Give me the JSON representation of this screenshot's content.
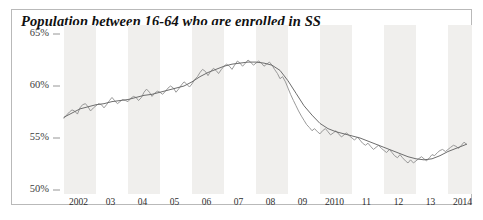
{
  "figure": {
    "width": 483,
    "height": 220,
    "background_color": "#ffffff",
    "frame_color": "#b9b9b9",
    "band_color": "#f0efed"
  },
  "chart_data": {
    "type": "line",
    "title": "Population between 16-64 who are enrolled in SS",
    "xlabel": "",
    "ylabel": "",
    "ylim": [
      50,
      65
    ],
    "xlim": [
      2002,
      2014.75
    ],
    "grid": false,
    "legend_position": "none",
    "y_tick_labels": [
      "65%",
      "60%",
      "55%",
      "50%"
    ],
    "y_tick_values": [
      65,
      60,
      55,
      50
    ],
    "x_tick_labels": [
      "2002",
      "03",
      "04",
      "05",
      "06",
      "07",
      "08",
      "09",
      "2010",
      "11",
      "12",
      "13",
      "2014"
    ],
    "x_tick_values": [
      2002,
      2003,
      2004,
      2005,
      2006,
      2007,
      2008,
      2009,
      2010,
      2011,
      2012,
      2013,
      2014
    ],
    "shaded_bands": [
      [
        2002,
        2003
      ],
      [
        2004,
        2005
      ],
      [
        2006,
        2007
      ],
      [
        2008,
        2009
      ],
      [
        2010,
        2011
      ],
      [
        2012,
        2013
      ],
      [
        2014,
        2014.75
      ]
    ],
    "series": [
      {
        "name": "Monthly (unadjusted)",
        "color": "#8e8e8e",
        "width": 0.9,
        "x": [
          2002.0,
          2002.08,
          2002.17,
          2002.25,
          2002.33,
          2002.42,
          2002.5,
          2002.58,
          2002.67,
          2002.75,
          2002.83,
          2002.92,
          2003.0,
          2003.08,
          2003.17,
          2003.25,
          2003.33,
          2003.42,
          2003.5,
          2003.58,
          2003.67,
          2003.75,
          2003.83,
          2003.92,
          2004.0,
          2004.08,
          2004.17,
          2004.25,
          2004.33,
          2004.42,
          2004.5,
          2004.58,
          2004.67,
          2004.75,
          2004.83,
          2004.92,
          2005.0,
          2005.08,
          2005.17,
          2005.25,
          2005.33,
          2005.42,
          2005.5,
          2005.58,
          2005.67,
          2005.75,
          2005.83,
          2005.92,
          2006.0,
          2006.08,
          2006.17,
          2006.25,
          2006.33,
          2006.42,
          2006.5,
          2006.58,
          2006.67,
          2006.75,
          2006.83,
          2006.92,
          2007.0,
          2007.08,
          2007.17,
          2007.25,
          2007.33,
          2007.42,
          2007.5,
          2007.58,
          2007.67,
          2007.75,
          2007.83,
          2007.92,
          2008.0,
          2008.08,
          2008.17,
          2008.25,
          2008.33,
          2008.42,
          2008.5,
          2008.58,
          2008.67,
          2008.75,
          2008.83,
          2008.92,
          2009.0,
          2009.08,
          2009.17,
          2009.25,
          2009.33,
          2009.42,
          2009.5,
          2009.58,
          2009.67,
          2009.75,
          2009.83,
          2009.92,
          2010.0,
          2010.08,
          2010.17,
          2010.25,
          2010.33,
          2010.42,
          2010.5,
          2010.58,
          2010.67,
          2010.75,
          2010.83,
          2010.92,
          2011.0,
          2011.08,
          2011.17,
          2011.25,
          2011.33,
          2011.42,
          2011.5,
          2011.58,
          2011.67,
          2011.75,
          2011.83,
          2011.92,
          2012.0,
          2012.08,
          2012.17,
          2012.25,
          2012.33,
          2012.42,
          2012.5,
          2012.58,
          2012.67,
          2012.75,
          2012.83,
          2012.92,
          2013.0,
          2013.08,
          2013.17,
          2013.25,
          2013.33,
          2013.42,
          2013.5,
          2013.58,
          2013.67,
          2013.75,
          2013.83,
          2013.92,
          2014.0,
          2014.08,
          2014.17,
          2014.25,
          2014.33,
          2014.42,
          2014.5,
          2014.58
        ],
        "y": [
          56.9,
          57.2,
          57.5,
          57.7,
          57.6,
          57.3,
          57.9,
          58.2,
          58.3,
          58.0,
          57.6,
          57.9,
          58.1,
          58.3,
          58.2,
          57.9,
          58.2,
          58.6,
          58.9,
          58.6,
          58.3,
          58.5,
          58.7,
          58.6,
          58.5,
          58.8,
          59.0,
          58.9,
          58.6,
          58.9,
          59.4,
          59.7,
          59.4,
          59.0,
          59.3,
          59.5,
          59.4,
          59.2,
          59.5,
          59.8,
          60.0,
          59.8,
          59.4,
          59.7,
          60.1,
          60.4,
          60.2,
          59.9,
          60.2,
          60.6,
          60.9,
          61.3,
          61.6,
          61.4,
          61.0,
          61.4,
          61.7,
          61.5,
          61.2,
          61.6,
          61.9,
          62.1,
          61.9,
          61.6,
          62.0,
          62.4,
          62.2,
          61.9,
          62.2,
          62.5,
          62.3,
          62.0,
          62.2,
          62.4,
          62.2,
          61.9,
          62.1,
          62.3,
          62.0,
          61.6,
          61.2,
          60.7,
          60.9,
          60.4,
          59.8,
          59.2,
          58.6,
          58.1,
          57.6,
          57.1,
          56.7,
          56.3,
          56.0,
          55.7,
          55.9,
          55.6,
          55.4,
          55.7,
          55.9,
          55.6,
          55.3,
          55.5,
          55.7,
          55.4,
          55.1,
          55.3,
          55.5,
          55.2,
          55.0,
          54.8,
          55.1,
          54.8,
          54.5,
          54.3,
          54.5,
          54.2,
          53.9,
          54.1,
          54.3,
          54.0,
          53.8,
          53.6,
          53.9,
          53.6,
          53.3,
          53.1,
          53.4,
          53.1,
          52.8,
          52.6,
          52.9,
          52.6,
          52.8,
          53.0,
          53.2,
          53.0,
          52.8,
          53.1,
          53.4,
          53.3,
          53.6,
          53.8,
          53.9,
          53.7,
          53.9,
          54.1,
          54.3,
          54.2,
          54.0,
          54.3,
          54.6,
          54.4
        ]
      },
      {
        "name": "Trend (smoothed)",
        "color": "#6d6d6d",
        "width": 1.0,
        "x": [
          2002.0,
          2002.25,
          2002.5,
          2002.75,
          2003.0,
          2003.25,
          2003.5,
          2003.75,
          2004.0,
          2004.25,
          2004.5,
          2004.75,
          2005.0,
          2005.25,
          2005.5,
          2005.75,
          2006.0,
          2006.25,
          2006.5,
          2006.75,
          2007.0,
          2007.25,
          2007.5,
          2007.75,
          2008.0,
          2008.25,
          2008.5,
          2008.75,
          2009.0,
          2009.25,
          2009.5,
          2009.75,
          2010.0,
          2010.25,
          2010.5,
          2010.75,
          2011.0,
          2011.25,
          2011.5,
          2011.75,
          2012.0,
          2012.25,
          2012.5,
          2012.75,
          2013.0,
          2013.25,
          2013.5,
          2013.75,
          2014.0,
          2014.25,
          2014.5,
          2014.58
        ],
        "y": [
          57.0,
          57.4,
          57.8,
          58.0,
          58.2,
          58.3,
          58.5,
          58.6,
          58.7,
          58.9,
          59.1,
          59.2,
          59.4,
          59.6,
          59.8,
          60.0,
          60.4,
          60.9,
          61.3,
          61.6,
          61.9,
          62.1,
          62.2,
          62.3,
          62.3,
          62.2,
          62.0,
          61.5,
          60.5,
          59.3,
          58.1,
          57.2,
          56.4,
          55.9,
          55.6,
          55.4,
          55.2,
          55.0,
          54.7,
          54.4,
          54.1,
          53.8,
          53.5,
          53.2,
          53.0,
          52.9,
          53.0,
          53.3,
          53.7,
          54.0,
          54.3,
          54.4
        ]
      }
    ]
  }
}
